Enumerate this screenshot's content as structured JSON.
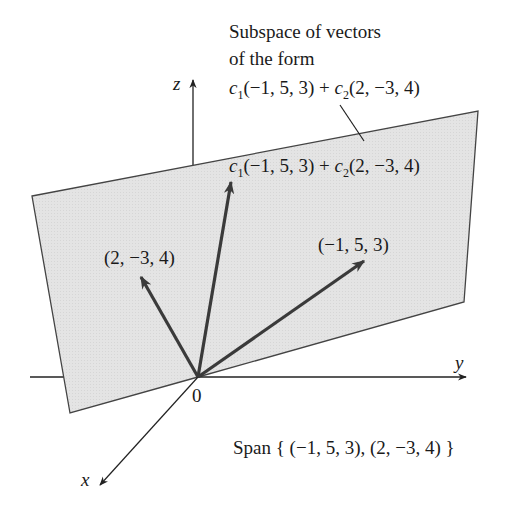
{
  "title_annotation": {
    "line1": "Subspace of vectors",
    "line2": "of the form",
    "expr_c1": "c",
    "expr_sub1": "1",
    "expr_mid": "(−1, 5, 3) + ",
    "expr_c2": "c",
    "expr_sub2": "2",
    "expr_end": "(2, −3, 4)"
  },
  "vector_label_combo": {
    "c1": "c",
    "sub1": "1",
    "mid": "(−1, 5, 3) + ",
    "c2": "c",
    "sub2": "2",
    "end": "(2, −3, 4)"
  },
  "vectors": {
    "v1": "(−1, 5, 3)",
    "v2": "(2, −3, 4)"
  },
  "axes": {
    "x": "x",
    "y": "y",
    "z": "z",
    "origin": "0"
  },
  "span_label": "Span { (−1, 5, 3), (2, −3, 4) }",
  "colors": {
    "plane_fill": "#e6e6e6",
    "stroke": "#333333",
    "vector": "#3a3a3a"
  }
}
